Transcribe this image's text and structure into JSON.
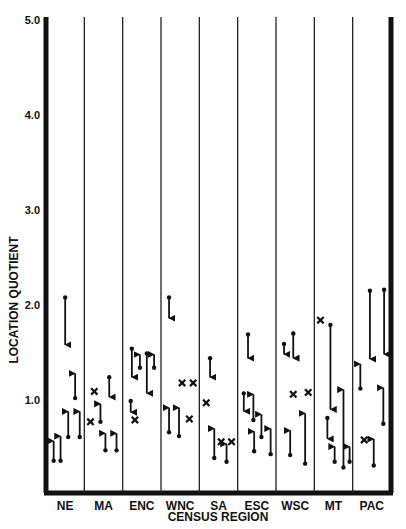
{
  "chart_data": {
    "type": "scatter",
    "title": "",
    "xlabel": "CENSUS REGION",
    "ylabel": "LOCATION QUOTIENT",
    "ylim": [
      0,
      5.0
    ],
    "yticks": [
      "1.0",
      "2.0",
      "3.0",
      "4.0",
      "5.0"
    ],
    "grid": false,
    "legend": null,
    "categories": [
      "NE",
      "MA",
      "ENC",
      "WNC",
      "SA",
      "ESC",
      "WSC",
      "MT",
      "PAC"
    ],
    "marker_types": {
      "arrow": "change in location quotient from start value to end value (arrow head at end)",
      "x": "single location quotient value (no change shown)"
    },
    "series": [
      {
        "region": "NE",
        "arrows": [
          {
            "dx": 0.5,
            "from": 2.08,
            "to": 1.57
          },
          {
            "dx": 0.76,
            "from": 1.02,
            "to": 1.29
          },
          {
            "dx": 0.58,
            "from": 0.61,
            "to": 0.89
          },
          {
            "dx": 0.88,
            "from": 0.61,
            "to": 0.89
          },
          {
            "dx": 0.2,
            "from": 0.36,
            "to": 0.58
          },
          {
            "dx": 0.38,
            "from": 0.36,
            "to": 0.63
          }
        ],
        "xs": []
      },
      {
        "region": "MA",
        "arrows": [
          {
            "dx": 0.65,
            "from": 1.24,
            "to": 1.02
          },
          {
            "dx": 0.42,
            "from": 0.77,
            "to": 0.97
          },
          {
            "dx": 0.55,
            "from": 0.47,
            "to": 0.66
          },
          {
            "dx": 0.84,
            "from": 0.47,
            "to": 0.66
          }
        ],
        "xs": [
          {
            "dx": 0.26,
            "value": 1.09
          },
          {
            "dx": 0.16,
            "value": 0.77
          }
        ]
      },
      {
        "region": "ENC",
        "arrows": [
          {
            "dx": 0.24,
            "from": 1.54,
            "to": 1.23
          },
          {
            "dx": 0.45,
            "from": 1.34,
            "to": 1.49
          },
          {
            "dx": 0.63,
            "from": 1.49,
            "to": 1.06
          },
          {
            "dx": 0.82,
            "from": 1.34,
            "to": 1.49
          },
          {
            "dx": 0.21,
            "from": 0.99,
            "to": 0.86
          }
        ],
        "xs": [
          {
            "dx": 0.32,
            "value": 0.79
          }
        ]
      },
      {
        "region": "WNC",
        "arrows": [
          {
            "dx": 0.21,
            "from": 2.08,
            "to": 1.85
          },
          {
            "dx": 0.21,
            "from": 0.66,
            "to": 0.93
          },
          {
            "dx": 0.47,
            "from": 0.62,
            "to": 0.93
          }
        ],
        "xs": [
          {
            "dx": 0.55,
            "value": 1.18
          },
          {
            "dx": 0.84,
            "value": 1.18
          },
          {
            "dx": 0.74,
            "value": 0.8
          }
        ]
      },
      {
        "region": "SA",
        "arrows": [
          {
            "dx": 0.28,
            "from": 1.44,
            "to": 1.23
          },
          {
            "dx": 0.39,
            "from": 0.39,
            "to": 0.71
          },
          {
            "dx": 0.71,
            "from": 0.35,
            "to": 0.55
          }
        ],
        "xs": [
          {
            "dx": 0.18,
            "value": 0.97
          },
          {
            "dx": 0.57,
            "value": 0.56
          },
          {
            "dx": 0.84,
            "value": 0.56
          }
        ]
      },
      {
        "region": "ESC",
        "arrows": [
          {
            "dx": 0.27,
            "from": 1.69,
            "to": 1.43
          },
          {
            "dx": 0.16,
            "from": 1.07,
            "to": 0.87
          },
          {
            "dx": 0.41,
            "from": 0.79,
            "to": 1.07
          },
          {
            "dx": 0.62,
            "from": 0.61,
            "to": 0.86
          },
          {
            "dx": 0.43,
            "from": 0.46,
            "to": 0.68
          },
          {
            "dx": 0.86,
            "from": 0.43,
            "to": 0.71
          }
        ],
        "xs": []
      },
      {
        "region": "WSC",
        "arrows": [
          {
            "dx": 0.21,
            "from": 1.59,
            "to": 1.47
          },
          {
            "dx": 0.45,
            "from": 1.7,
            "to": 1.43
          },
          {
            "dx": 0.37,
            "from": 0.42,
            "to": 0.69
          },
          {
            "dx": 0.76,
            "from": 0.33,
            "to": 0.87
          }
        ],
        "xs": [
          {
            "dx": 0.45,
            "value": 1.06
          },
          {
            "dx": 0.84,
            "value": 1.08
          }
        ]
      },
      {
        "region": "MT",
        "arrows": [
          {
            "dx": 0.42,
            "from": 1.79,
            "to": 0.89
          },
          {
            "dx": 0.34,
            "from": 0.81,
            "to": 0.58
          },
          {
            "dx": 0.53,
            "from": 0.35,
            "to": 0.52
          },
          {
            "dx": 0.76,
            "from": 0.29,
            "to": 1.12
          },
          {
            "dx": 0.92,
            "from": 0.35,
            "to": 0.52
          }
        ],
        "xs": [
          {
            "dx": 0.16,
            "value": 1.84
          }
        ]
      },
      {
        "region": "PAC",
        "arrows": [
          {
            "dx": 0.45,
            "from": 2.15,
            "to": 1.42
          },
          {
            "dx": 0.82,
            "from": 2.16,
            "to": 1.47
          },
          {
            "dx": 0.2,
            "from": 1.12,
            "to": 1.39
          },
          {
            "dx": 0.8,
            "from": 0.75,
            "to": 1.14
          },
          {
            "dx": 0.55,
            "from": 0.31,
            "to": 0.6
          }
        ],
        "xs": [
          {
            "dx": 0.3,
            "value": 0.58
          }
        ]
      }
    ]
  },
  "axes": {
    "x_title": "CENSUS REGION",
    "y_title": "LOCATION QUOTIENT"
  }
}
